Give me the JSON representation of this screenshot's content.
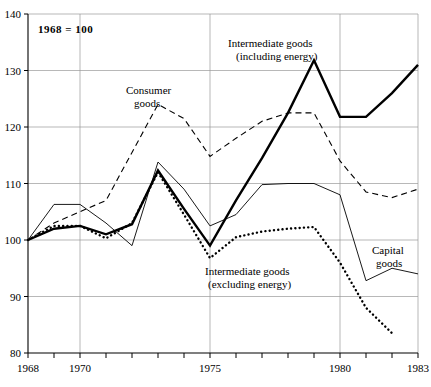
{
  "chart_data": {
    "type": "line",
    "title": "",
    "annotation_index_base": "1968 = 100",
    "xlabel": "",
    "ylabel": "",
    "xlim": [
      1968,
      1983
    ],
    "ylim": [
      80,
      140
    ],
    "yticks": [
      80,
      90,
      100,
      110,
      120,
      130,
      140
    ],
    "ytick_labels": [
      "80",
      "90",
      "100",
      "110",
      "120",
      "130",
      "140"
    ],
    "xticks": [
      1968,
      1969,
      1970,
      1971,
      1972,
      1973,
      1974,
      1975,
      1976,
      1977,
      1978,
      1979,
      1980,
      1981,
      1982,
      1983
    ],
    "xtick_labels_shown": [
      "1968",
      "1970",
      "1975",
      "1980",
      "1983"
    ],
    "grid": "horizontal-and-vertical-at-labeled-years",
    "legend_position": "inline-annotations",
    "x": [
      1968,
      1969,
      1970,
      1971,
      1972,
      1973,
      1974,
      1975,
      1976,
      1977,
      1978,
      1979,
      1980,
      1981,
      1982,
      1983
    ],
    "series": [
      {
        "name": "Consumer goods",
        "style": "dashed",
        "label_text": "Consumer\ngoods",
        "values": [
          100.0,
          103.0,
          105.0,
          107.0,
          115.5,
          124.0,
          121.5,
          114.8,
          118.0,
          121.0,
          122.5,
          122.5,
          114.0,
          108.5,
          107.5,
          109.0
        ]
      },
      {
        "name": "Intermediate goods (including energy)",
        "style": "bold-solid",
        "label_text": "Intermediate goods\n(including energy)",
        "values": [
          100.0,
          102.0,
          102.5,
          101.0,
          102.8,
          112.3,
          105.5,
          99.0,
          107.0,
          114.5,
          122.5,
          131.8,
          121.8,
          121.8,
          126.0,
          131.0
        ]
      },
      {
        "name": "Intermediate goods (excluding energy)",
        "style": "dotted",
        "label_text": "Intermediate goods\n(excluding energy)",
        "values": [
          100.0,
          102.5,
          102.5,
          100.3,
          103.0,
          112.0,
          104.5,
          96.8,
          100.5,
          101.5,
          102.0,
          102.3,
          96.0,
          88.0,
          83.5,
          null
        ]
      },
      {
        "name": "Capital goods",
        "style": "thin-solid",
        "label_text": "Capital\ngoods",
        "values": [
          100.0,
          106.3,
          106.3,
          103.0,
          99.0,
          113.8,
          109.0,
          102.5,
          104.5,
          109.8,
          110.0,
          110.0,
          108.0,
          92.8,
          95.0,
          94.0
        ]
      }
    ],
    "annotations": [
      {
        "name": "index-base-note",
        "text": "1968  =  100",
        "bold": true
      },
      {
        "name": "consumer-goods-label",
        "line1": "Consumer",
        "line2": "goods"
      },
      {
        "name": "intermediate-including-label",
        "line1": "Intermediate goods",
        "line2": "(including energy)"
      },
      {
        "name": "intermediate-excluding-label",
        "line1": "Intermediate goods",
        "line2": "(excluding energy)"
      },
      {
        "name": "capital-goods-label",
        "line1": "Capital",
        "line2": "goods"
      }
    ],
    "colors": {
      "ink": "#000000",
      "grid": "#9a9a9a",
      "background": "#ffffff"
    }
  }
}
